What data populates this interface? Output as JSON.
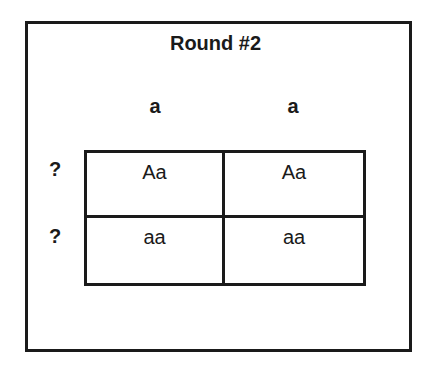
{
  "title": "Round #2",
  "columns": [
    "a",
    "a"
  ],
  "rows": [
    "?",
    "?"
  ],
  "cells": [
    [
      "Aa",
      "Aa"
    ],
    [
      "aa",
      "aa"
    ]
  ]
}
